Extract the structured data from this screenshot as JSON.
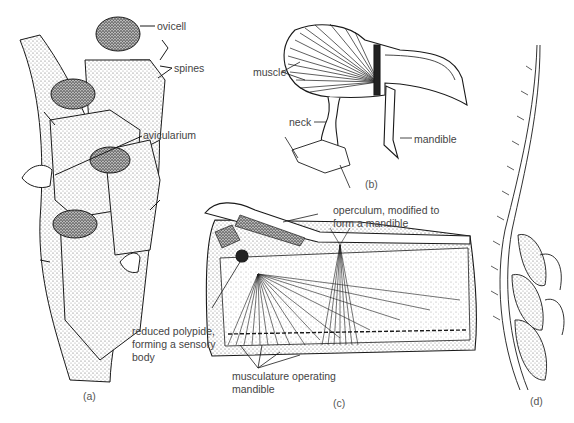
{
  "figure": {
    "panels": [
      {
        "id": "a",
        "caption": "(a)",
        "labels": [
          "ovicell",
          "spines",
          "avicularium"
        ]
      },
      {
        "id": "b",
        "caption": "(b)",
        "labels": [
          "muscle",
          "neck",
          "mandible"
        ]
      },
      {
        "id": "c",
        "caption": "(c)",
        "labels": [
          "operculum, modified to form a mandible",
          "reduced polypide, forming a sensory body",
          "musculature operating mandible"
        ]
      },
      {
        "id": "d",
        "caption": "(d)",
        "labels": []
      }
    ]
  },
  "labels": {
    "ovicell": "ovicell",
    "spines": "spines",
    "avicularium": "avicularium",
    "muscle": "muscle",
    "neck": "neck",
    "mandible_b": "mandible",
    "operculum_line1": "operculum, modified to",
    "operculum_line2": "form a mandible",
    "polypide_line1": "reduced polypide,",
    "polypide_line2": "forming a sensory",
    "polypide_line3": "body",
    "musculature_line1": "musculature operating",
    "musculature_line2": "mandible"
  },
  "captions": {
    "a": "(a)",
    "b": "(b)",
    "c": "(c)",
    "d": "(d)"
  },
  "colors": {
    "ink": "#1a1a1a",
    "stipple": "#9a9a9a",
    "background": "#ffffff",
    "label_text": "#444444"
  }
}
